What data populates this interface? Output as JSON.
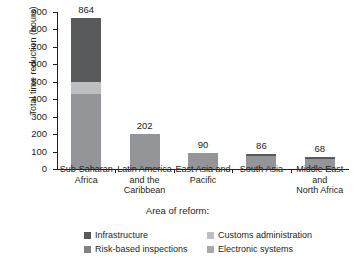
{
  "chart_data": {
    "type": "bar",
    "stacked": true,
    "title": "",
    "xlabel": "Area of reform:",
    "ylabel": "Total time reduction (hours)",
    "ylim": [
      0,
      900
    ],
    "ytick_values": [
      0,
      100,
      200,
      300,
      400,
      500,
      600,
      700,
      800,
      900
    ],
    "ytick_labels": [
      "0",
      "100",
      "200",
      "300",
      "400",
      "500",
      "600",
      "700",
      "800",
      "900"
    ],
    "grid": false,
    "legend_position": "bottom",
    "categories": [
      "Sub-Saharan Africa",
      "Latin America and the Caribbean",
      "East Asia and Pacific",
      "South Asia",
      "Middle East and North Africa"
    ],
    "category_lines": [
      [
        "Sub-Saharan",
        "Africa"
      ],
      [
        "Latin America",
        "and the",
        "Caribbean"
      ],
      [
        "East Asia and",
        "Pacific"
      ],
      [
        "South Asia"
      ],
      [
        "Middle East",
        "and",
        "North Africa"
      ]
    ],
    "totals": [
      864,
      202,
      90,
      86,
      68
    ],
    "total_labels": [
      "864",
      "202",
      "90",
      "86",
      "68"
    ],
    "series": [
      {
        "name": "Infrastructure",
        "color": "#58595b",
        "values": [
          364,
          0,
          0,
          14,
          10
        ]
      },
      {
        "name": "Customs administration",
        "color": "#bcbec0",
        "values": [
          70,
          0,
          0,
          0,
          0
        ]
      },
      {
        "name": "Risk-based inspections",
        "color": "#939598",
        "values": [
          430,
          202,
          90,
          72,
          58
        ]
      },
      {
        "name": "Electronic systems",
        "color": "#a7a9ac",
        "values": [
          0,
          0,
          0,
          0,
          0
        ]
      }
    ],
    "legend_entries": [
      {
        "label": "Infrastructure",
        "color": "#58595b"
      },
      {
        "label": "Customs administration",
        "color": "#bcbec0"
      },
      {
        "label": "Risk-based inspections",
        "color": "#808285"
      },
      {
        "label": "Electronic systems",
        "color": "#a7a9ac"
      }
    ]
  }
}
